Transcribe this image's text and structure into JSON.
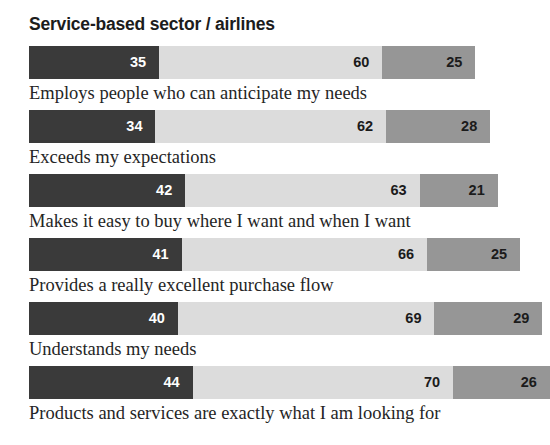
{
  "chart_data": {
    "type": "bar",
    "title": "Service-based sector / airlines",
    "xlabel": "",
    "ylabel": "",
    "orientation": "horizontal",
    "stacked": true,
    "grid": false,
    "legend": "none",
    "categories": [
      "Employs people who can anticipate my needs",
      "Exceeds my expectations",
      "Makes it easy to buy where I want and when I want",
      "Provides a really excellent purchase flow",
      "Understands my needs",
      "Products and services are exactly what I am looking for"
    ],
    "series": [
      {
        "name": "segment-1",
        "color": "#3a3a3a",
        "values": [
          35,
          34,
          42,
          41,
          40,
          44
        ]
      },
      {
        "name": "segment-2",
        "color": "#dcdcdc",
        "values": [
          60,
          62,
          63,
          66,
          69,
          70
        ]
      },
      {
        "name": "segment-3",
        "color": "#969696",
        "values": [
          25,
          28,
          21,
          25,
          29,
          26
        ]
      }
    ],
    "bars": [
      {
        "label": "Employs people who can anticipate my needs",
        "segments": [
          {
            "value": "35",
            "style": "dark"
          },
          {
            "value": "60",
            "style": "light"
          },
          {
            "value": "25",
            "style": "medium"
          }
        ]
      },
      {
        "label": "Exceeds my expectations",
        "segments": [
          {
            "value": "34",
            "style": "dark"
          },
          {
            "value": "62",
            "style": "light"
          },
          {
            "value": "28",
            "style": "medium"
          }
        ]
      },
      {
        "label": "Makes it easy to buy where I want and when I want",
        "segments": [
          {
            "value": "42",
            "style": "dark"
          },
          {
            "value": "63",
            "style": "light"
          },
          {
            "value": "21",
            "style": "medium"
          }
        ]
      },
      {
        "label": "Provides a really excellent purchase flow",
        "segments": [
          {
            "value": "41",
            "style": "dark"
          },
          {
            "value": "66",
            "style": "light"
          },
          {
            "value": "25",
            "style": "medium"
          }
        ]
      },
      {
        "label": "Understands my needs",
        "segments": [
          {
            "value": "40",
            "style": "dark"
          },
          {
            "value": "69",
            "style": "light"
          },
          {
            "value": "29",
            "style": "medium"
          }
        ]
      },
      {
        "label": "Products and services are exactly what I am looking for",
        "segments": [
          {
            "value": "44",
            "style": "dark"
          },
          {
            "value": "70",
            "style": "light"
          },
          {
            "value": "26",
            "style": "medium"
          }
        ]
      }
    ],
    "colors": {
      "segment_dark": "#3a3a3a",
      "segment_light": "#dcdcdc",
      "segment_medium": "#969696",
      "background": "#ffffff",
      "title_text": "#1c1c1c",
      "label_text": "#252525"
    }
  }
}
